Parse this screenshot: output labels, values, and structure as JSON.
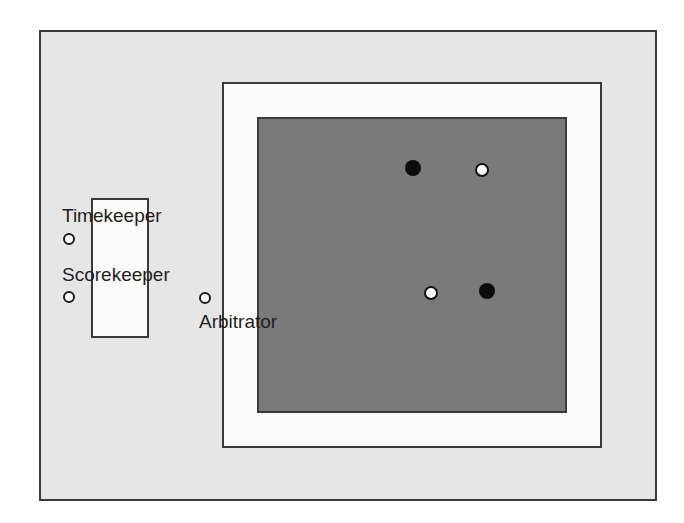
{
  "diagram": {
    "type": "competition-area-layout",
    "colors": {
      "outer_area": "#e6e6e6",
      "safety_area": "#fbfbfb",
      "contest_mat": "#7a7a7a",
      "border": "#3a3a3a",
      "competitor_black": "#0c0c0c",
      "competitor_white": "#fbfbfb"
    },
    "officials": [
      {
        "label": "Timekeeper",
        "marker": "open-circle"
      },
      {
        "label": "Scorekeeper",
        "marker": "open-circle"
      },
      {
        "label": "Arbitrator",
        "marker": "open-circle"
      }
    ],
    "players": [
      {
        "color": "black",
        "position": "top-left"
      },
      {
        "color": "white",
        "position": "top-right"
      },
      {
        "color": "white",
        "position": "bottom-left"
      },
      {
        "color": "black",
        "position": "bottom-right"
      }
    ]
  }
}
